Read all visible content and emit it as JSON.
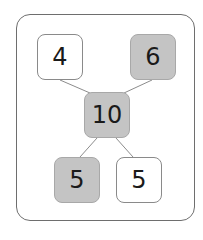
{
  "diagram": {
    "type": "number-bond",
    "top_left": {
      "value": "4",
      "shaded": false
    },
    "top_right": {
      "value": "6",
      "shaded": true
    },
    "center": {
      "value": "10",
      "shaded": true
    },
    "bottom_left": {
      "value": "5",
      "shaded": true
    },
    "bottom_right": {
      "value": "5",
      "shaded": false
    }
  },
  "colors": {
    "shaded_fill": "#c4c4c4",
    "border": "#8a8a8a",
    "line": "#8c8c8c"
  }
}
